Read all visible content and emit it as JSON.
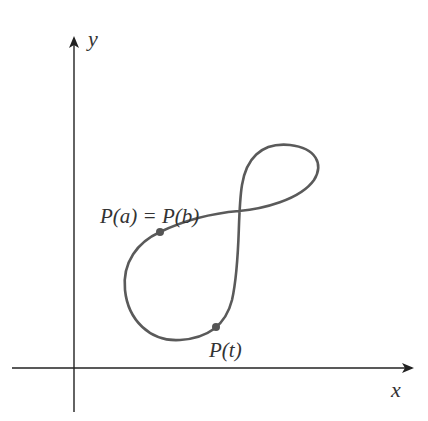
{
  "diagram": {
    "axes": {
      "x_label": "x",
      "y_label": "y",
      "color": "#222222"
    },
    "curve": {
      "color": "#5a5a5a",
      "shape": "figure-eight loop"
    },
    "points": [
      {
        "id": "pa",
        "label": "P(a) = P(b)",
        "color": "#555555"
      },
      {
        "id": "pt",
        "label": "P(t)",
        "color": "#555555"
      }
    ]
  }
}
